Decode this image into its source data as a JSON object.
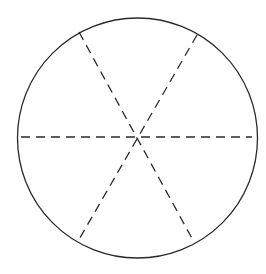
{
  "diagram": {
    "type": "circle-divided-into-six-sectors",
    "canvas": {
      "width": 266,
      "height": 274,
      "background": "#ffffff"
    },
    "circle": {
      "cx": 137.5,
      "cy": 138,
      "r": 120,
      "stroke": "#2a2a2a",
      "stroke_width": 1.3
    },
    "divider_lines": {
      "style": "dashed",
      "stroke": "#2a2a2a",
      "stroke_width": 1.3,
      "dasharray": "9,6",
      "lines": [
        {
          "name": "horizontal-diameter",
          "x1": 21,
          "y1": 137,
          "x2": 252,
          "y2": 137
        },
        {
          "name": "diagonal-diameter-descending",
          "x1": 79,
          "y1": 32,
          "x2": 194,
          "y2": 242
        },
        {
          "name": "diagonal-diameter-ascending",
          "x1": 197,
          "y1": 35,
          "x2": 77,
          "y2": 243
        }
      ]
    }
  }
}
